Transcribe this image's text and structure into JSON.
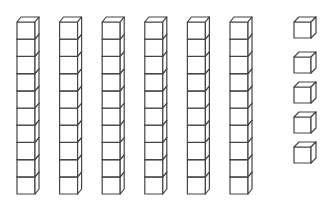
{
  "diagram": {
    "type": "base-ten-blocks",
    "tens_rods": 6,
    "cubes_per_rod": 10,
    "unit_cubes": 5,
    "represented_value": 65,
    "stroke_color": "#444444",
    "fill_color": "#ffffff"
  }
}
